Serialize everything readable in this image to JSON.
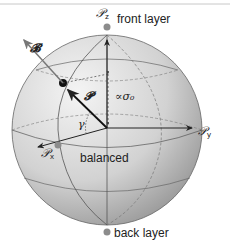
{
  "diagram": {
    "labels": {
      "pz_symbol": "𝒫",
      "pz_sub": "z",
      "px_symbol": "𝒫",
      "px_sub": "x",
      "py_symbol": "𝒫",
      "py_sub": "y",
      "front_layer": "front layer",
      "back_layer": "back layer",
      "balanced": "balanced",
      "vector_P": "𝓟",
      "vector_B": "𝓑",
      "proportional": "∝σ₀",
      "angle": "γ"
    },
    "colors": {
      "sphere_light": "#f2f2f2",
      "sphere_dark": "#8a8a8a",
      "line": "#555555",
      "arrow": "#222222",
      "pole_dot": "#8c8c8c",
      "top_rule": "#bbbbbb"
    }
  }
}
